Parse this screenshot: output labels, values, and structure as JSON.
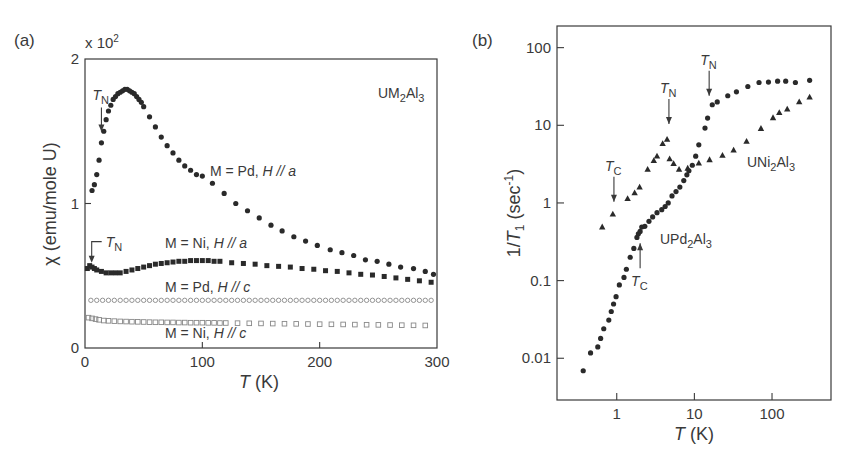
{
  "chart_data": [
    {
      "panel": "(a)",
      "type": "scatter",
      "title": "",
      "compound_label": {
        "base": "UM",
        "sub1": "2",
        "mid": "Al",
        "sub2": "3"
      },
      "xlabel": {
        "var": "T",
        "unit": " (K)"
      },
      "ylabel": "χ (emu/mole U)",
      "y_multiplier": {
        "prefix": "x 10",
        "exp": "2"
      },
      "xlim": [
        0,
        300
      ],
      "ylim": [
        0,
        2
      ],
      "xticks": [
        0,
        100,
        200,
        300
      ],
      "yticks": [
        0,
        1,
        2
      ],
      "grid": false,
      "series": [
        {
          "name": "M = Pd, H // a",
          "label": {
            "text": "M = Pd, ",
            "ital": "H // a"
          },
          "marker": "filled-circle",
          "x": [
            6,
            8,
            10,
            12,
            14,
            16,
            18,
            20,
            22,
            24,
            26,
            28,
            30,
            32,
            34,
            36,
            38,
            40,
            42,
            44,
            46,
            48,
            50,
            55,
            60,
            65,
            70,
            75,
            80,
            85,
            90,
            95,
            100,
            108.6,
            118.6,
            128.5,
            138.5,
            148.5,
            158.5,
            168,
            178,
            188,
            198,
            209,
            219,
            229,
            239,
            249,
            259,
            269,
            280,
            290,
            297
          ],
          "y": [
            1.09,
            1.13,
            1.2,
            1.3,
            1.42,
            1.5,
            1.58,
            1.64,
            1.68,
            1.72,
            1.74,
            1.76,
            1.77,
            1.78,
            1.79,
            1.79,
            1.78,
            1.77,
            1.76,
            1.74,
            1.72,
            1.7,
            1.67,
            1.6,
            1.53,
            1.46,
            1.4,
            1.35,
            1.3,
            1.26,
            1.23,
            1.2,
            1.19,
            1.14,
            1.07,
            1.0,
            0.95,
            0.9,
            0.85,
            0.81,
            0.77,
            0.74,
            0.71,
            0.68,
            0.66,
            0.64,
            0.61,
            0.6,
            0.58,
            0.56,
            0.55,
            0.53,
            0.51
          ]
        },
        {
          "name": "M = Ni, H // a",
          "label": {
            "text": "M = Ni, ",
            "ital": "H // a"
          },
          "marker": "filled-square",
          "x": [
            2,
            4,
            6,
            8,
            10,
            14,
            18,
            22,
            26,
            30,
            35,
            40,
            45,
            50,
            55,
            60,
            65,
            70,
            75,
            80,
            85,
            90,
            95,
            100,
            105,
            110,
            115,
            125,
            135,
            145,
            155,
            165,
            175,
            185,
            195,
            205,
            215,
            225,
            235,
            245,
            255,
            265,
            275,
            285,
            295
          ],
          "y": [
            0.55,
            0.57,
            0.56,
            0.55,
            0.54,
            0.53,
            0.52,
            0.52,
            0.52,
            0.52,
            0.53,
            0.54,
            0.55,
            0.56,
            0.57,
            0.58,
            0.585,
            0.59,
            0.595,
            0.6,
            0.6,
            0.605,
            0.605,
            0.605,
            0.605,
            0.6,
            0.6,
            0.59,
            0.585,
            0.58,
            0.57,
            0.565,
            0.56,
            0.55,
            0.545,
            0.535,
            0.53,
            0.52,
            0.51,
            0.505,
            0.495,
            0.485,
            0.475,
            0.465,
            0.455
          ]
        },
        {
          "name": "M = Pd, H // c",
          "label": {
            "text": "M = Pd, ",
            "ital": "H // c"
          },
          "marker": "open-circle",
          "x": [
            5,
            10,
            15,
            20,
            25,
            30,
            35,
            40,
            45,
            50,
            55,
            60,
            65,
            70,
            75,
            80,
            85,
            90,
            95,
            100,
            105,
            110,
            115,
            120,
            125,
            130,
            135,
            140,
            145,
            150,
            155,
            160,
            165,
            170,
            175,
            180,
            185,
            190,
            195,
            200,
            205,
            210,
            215,
            220,
            225,
            230,
            235,
            240,
            245,
            250,
            255,
            260,
            265,
            270,
            275,
            280,
            285,
            290,
            295
          ],
          "y": [
            0.33,
            0.33,
            0.33,
            0.33,
            0.33,
            0.33,
            0.33,
            0.33,
            0.33,
            0.33,
            0.33,
            0.33,
            0.33,
            0.33,
            0.33,
            0.33,
            0.33,
            0.33,
            0.33,
            0.33,
            0.33,
            0.33,
            0.33,
            0.33,
            0.33,
            0.33,
            0.33,
            0.33,
            0.33,
            0.33,
            0.33,
            0.33,
            0.33,
            0.33,
            0.33,
            0.33,
            0.33,
            0.33,
            0.33,
            0.33,
            0.33,
            0.33,
            0.33,
            0.33,
            0.33,
            0.33,
            0.33,
            0.33,
            0.33,
            0.33,
            0.33,
            0.33,
            0.33,
            0.33,
            0.33,
            0.33,
            0.33,
            0.33,
            0.33
          ]
        },
        {
          "name": "M = Ni, H // c",
          "label": {
            "text": "M = Ni, ",
            "ital": "H // c"
          },
          "marker": "open-square",
          "x": [
            3,
            6,
            9,
            12,
            16,
            20,
            25,
            30,
            35,
            40,
            45,
            50,
            55,
            60,
            65,
            70,
            75,
            80,
            85,
            90,
            95,
            100,
            105,
            110,
            115,
            120,
            130,
            140,
            150,
            160,
            170,
            180,
            190,
            200,
            210,
            220,
            230,
            240,
            250,
            260,
            270,
            280,
            290
          ],
          "y": [
            0.21,
            0.205,
            0.2,
            0.195,
            0.19,
            0.188,
            0.186,
            0.184,
            0.183,
            0.182,
            0.181,
            0.18,
            0.179,
            0.178,
            0.178,
            0.177,
            0.177,
            0.176,
            0.176,
            0.175,
            0.175,
            0.175,
            0.174,
            0.174,
            0.173,
            0.173,
            0.172,
            0.171,
            0.17,
            0.169,
            0.168,
            0.167,
            0.166,
            0.165,
            0.164,
            0.163,
            0.162,
            0.161,
            0.16,
            0.159,
            0.158,
            0.157,
            0.156
          ]
        }
      ],
      "annotations": [
        {
          "text_var": "T",
          "text_sub": "N",
          "x": 14,
          "y": 1.47,
          "series": "M = Pd, H // a"
        },
        {
          "text_var": "T",
          "text_sub": "N",
          "x": 4,
          "y": 0.57,
          "series": "M = Ni, H // a"
        }
      ]
    },
    {
      "panel": "(b)",
      "type": "scatter",
      "title": "",
      "xlabel": {
        "var": "T",
        "unit": " (K)"
      },
      "ylabel": {
        "pre": "1/",
        "var": "T",
        "sub": "1",
        "unit": " (sec",
        "exp": "-1",
        "close": ")"
      },
      "xscale": "log",
      "yscale": "log",
      "xlim": [
        0.17,
        575
      ],
      "ylim": [
        0.0029,
        190
      ],
      "xticks": [
        1,
        10,
        100
      ],
      "xticklabels": [
        "1",
        "10",
        "100"
      ],
      "yticks": [
        0.01,
        0.1,
        1,
        10,
        100
      ],
      "yticklabels": [
        "0.01",
        "0.1",
        "1",
        "10",
        "100"
      ],
      "grid": false,
      "series": [
        {
          "name": "UPd2Al3",
          "label": {
            "base": "UPd",
            "sub1": "2",
            "mid": "Al",
            "sub2": "3"
          },
          "marker": "filled-circle",
          "x": [
            0.37,
            0.46,
            0.57,
            0.62,
            0.68,
            0.79,
            0.85,
            0.91,
            0.98,
            1.08,
            1.24,
            1.33,
            1.49,
            1.66,
            1.82,
            1.9,
            2.0,
            2.1,
            2.3,
            2.6,
            2.9,
            3.3,
            3.8,
            4.2,
            4.6,
            5.15,
            5.8,
            6.5,
            7.3,
            8.0,
            8.5,
            9.4,
            10.4,
            11.4,
            13.7,
            14.8,
            17,
            19.7,
            26.9,
            34.8,
            48.8,
            68,
            90,
            118,
            150,
            200,
            305
          ],
          "y": [
            0.0069,
            0.0117,
            0.014,
            0.018,
            0.024,
            0.031,
            0.04,
            0.05,
            0.062,
            0.088,
            0.11,
            0.14,
            0.2,
            0.26,
            0.36,
            0.4,
            0.43,
            0.49,
            0.5,
            0.58,
            0.66,
            0.75,
            0.82,
            0.9,
            1.0,
            1.23,
            1.4,
            1.6,
            1.94,
            2.3,
            2.6,
            3.06,
            4.0,
            5.6,
            9.2,
            12.4,
            18.4,
            20,
            24,
            27,
            31.6,
            35.6,
            36,
            37,
            37,
            35.6,
            38
          ]
        },
        {
          "name": "UNi2Al3",
          "label": {
            "base": "UNi",
            "sub1": "2",
            "mid": "Al",
            "sub2": "3"
          },
          "marker": "filled-triangle",
          "x": [
            0.65,
            0.89,
            1.38,
            1.7,
            1.97,
            2.5,
            3.0,
            3.3,
            3.9,
            4.45,
            4.8,
            5.4,
            6.35,
            8.2,
            11.4,
            15.7,
            23,
            32,
            47,
            72,
            103,
            124,
            157,
            224,
            305
          ],
          "y": [
            0.49,
            0.72,
            1.14,
            1.35,
            1.6,
            2.7,
            3.5,
            4.0,
            5.8,
            6.6,
            3.7,
            3.2,
            2.7,
            2.8,
            3.25,
            3.6,
            4.1,
            4.8,
            6.2,
            9.1,
            12.5,
            14.6,
            16.2,
            20,
            23
          ]
        }
      ],
      "annotations": [
        {
          "text_var": "T",
          "text_sub": "C",
          "x": 0.92,
          "y": 0.95,
          "direction": "down",
          "series": "UNi2Al3"
        },
        {
          "text_var": "T",
          "text_sub": "N",
          "x": 4.7,
          "y": 9.5,
          "direction": "down",
          "series": "UNi2Al3"
        },
        {
          "text_var": "T",
          "text_sub": "N",
          "x": 15.5,
          "y": 22,
          "direction": "down",
          "series": "UPd2Al3"
        },
        {
          "text_var": "T",
          "text_sub": "C",
          "x": 2.0,
          "y": 0.33,
          "direction": "up",
          "series": "UPd2Al3"
        }
      ]
    }
  ]
}
